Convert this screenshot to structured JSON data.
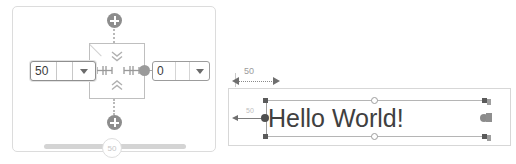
{
  "left_panel": {
    "name": "component-editor-panel",
    "top_add_button": {
      "icon": "plus-circle-icon",
      "label": "+"
    },
    "bottom_add_button": {
      "icon": "plus-circle-icon",
      "label": "+"
    },
    "center_component": {
      "chevron_down_icon": "chevron-double-down-icon",
      "chevron_up_icon": "chevron-double-up-icon",
      "left_glyph": "measure-handle-icon",
      "right_glyph": "measure-handle-icon",
      "corner_mark": "diagonal-corner-mark"
    },
    "left_field": {
      "value": "50",
      "placeholder": "",
      "dropdown_icon": "chevron-down-icon"
    },
    "right_field": {
      "value": "0",
      "placeholder": "",
      "dropdown_icon": "chevron-down-icon"
    },
    "slider": {
      "value": "50",
      "min": "0",
      "max": "100"
    }
  },
  "right_panel": {
    "name": "canvas-preview-panel",
    "dimension_top": {
      "value": "50",
      "left_arrow_icon": "arrow-left-icon",
      "right_arrow_icon": "arrow-right-icon"
    },
    "dimension_left": {
      "value": "50",
      "arrow_icon": "arrow-left-icon"
    },
    "text_object": {
      "content": "Hello World!"
    }
  },
  "colors": {
    "panel_border": "#dcdcdc",
    "field_border": "#9c9c9c",
    "accent_gray": "#8d8d8d",
    "text": "#404040",
    "dim_label": "#9b9b9b",
    "slider_track": "#d4d4d4"
  }
}
